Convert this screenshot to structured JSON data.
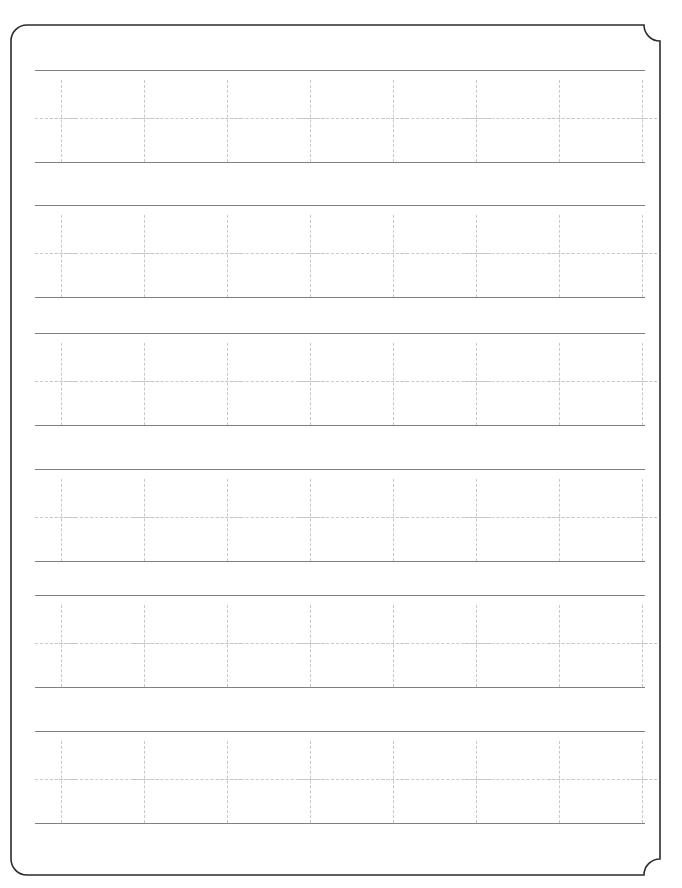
{
  "page": {
    "title": "Letter Tracing Practice Worksheet",
    "width": 682,
    "height": 888,
    "background_color": "#ffffff"
  },
  "frame": {
    "name": "decorative-page-border",
    "style": "inverted-rounded-corner-notches",
    "stroke_color": "#2b2b30",
    "stroke_width": 1.6,
    "inset_left": 11,
    "inset_top": 25,
    "inset_right": 22,
    "inset_bottom": 13,
    "corner_radius": 16
  },
  "guides": {
    "solid_line_color": "#7f7f83",
    "dashed_guide_color": "#c9c9cf",
    "glyph_color": "#c7c7cd",
    "row_height": 92,
    "midline_offset": 48,
    "line_left": 35,
    "line_width": 610
  },
  "practice": {
    "letter": "t",
    "letter_case": "lowercase",
    "glyph_type": "dashed-trace-guide",
    "glyphs_per_row": 8,
    "glyph_spacing": 83,
    "first_glyph_x": 13,
    "row_count": 6,
    "rows": [
      {
        "index": 1,
        "top": 70,
        "label": "practice-row-1"
      },
      {
        "index": 2,
        "top": 205,
        "label": "practice-row-2"
      },
      {
        "index": 3,
        "top": 333,
        "label": "practice-row-3"
      },
      {
        "index": 4,
        "top": 469,
        "label": "practice-row-4"
      },
      {
        "index": 5,
        "top": 595,
        "label": "practice-row-5"
      },
      {
        "index": 6,
        "top": 731,
        "label": "practice-row-6"
      }
    ]
  }
}
